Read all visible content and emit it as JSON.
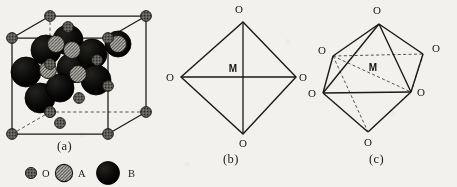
{
  "figure": {
    "background_color": "#f2f1ee",
    "line_color": "#1a1916",
    "panels": [
      {
        "id": "a",
        "caption": "(a)",
        "description": "perovskite-unit-cell"
      },
      {
        "id": "b",
        "caption": "(b)",
        "description": "octahedron-planar-projection"
      },
      {
        "id": "c",
        "caption": "(c)",
        "description": "octahedron-perspective"
      }
    ]
  },
  "panel_a": {
    "caption": "(a)",
    "cube": {
      "front_face": {
        "x": 12,
        "y": 38,
        "w": 96,
        "h": 96
      },
      "depth_dx": 38,
      "depth_dy": -26,
      "solid_edges": 9,
      "dashed_edges": 3
    },
    "atoms": {
      "O": {
        "label": "O",
        "radius": 5.2,
        "fill": "#5b5a56",
        "stroke": "#181713",
        "style": "speckled"
      },
      "A": {
        "label": "A",
        "radius": 8.5,
        "fill": "#b9b8b2",
        "stroke": "#15140f",
        "style": "hatched"
      },
      "B": {
        "label": "B",
        "radius": 14.5,
        "fill": "#080807",
        "stroke": "#000000",
        "style": "solid"
      }
    }
  },
  "panel_b": {
    "caption": "(b)",
    "center_label": "M",
    "vertex_labels": {
      "top": "O",
      "left": "O",
      "right": "O",
      "bottom": "O"
    },
    "geometry": {
      "top": [
        80,
        22
      ],
      "left": [
        18,
        77
      ],
      "right": [
        133,
        77
      ],
      "bottom": [
        80,
        134
      ],
      "center": [
        80,
        77
      ]
    }
  },
  "panel_c": {
    "caption": "(c)",
    "center_label": "M",
    "vertex_labels": {
      "apex": "O",
      "upper_left": "O",
      "upper_right": "O",
      "lower_left": "O",
      "lower_right": "O",
      "bottom": "O"
    },
    "geometry": {
      "apex": [
        76,
        24
      ],
      "upper_left": [
        30,
        56
      ],
      "upper_right": [
        120,
        54
      ],
      "lower_left": [
        20,
        93
      ],
      "lower_right": [
        108,
        92
      ],
      "bottom": [
        65,
        132
      ],
      "center": [
        70,
        76
      ]
    },
    "hidden_edges_dashed": 5
  },
  "legend": {
    "items": [
      {
        "symbol": "O",
        "label": "O",
        "kind": "oxygen-sphere"
      },
      {
        "symbol": "A",
        "label": "A",
        "kind": "a-site-sphere"
      },
      {
        "symbol": "B",
        "label": "B",
        "kind": "b-site-sphere"
      }
    ]
  }
}
